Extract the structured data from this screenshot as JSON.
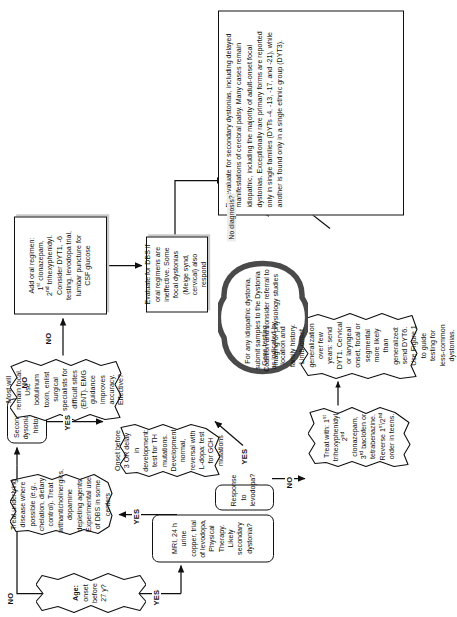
{
  "figure": {
    "type": "clinical-decision-flowchart",
    "orientation": "rotated-90-ccw",
    "background_color": "#ffffff",
    "ink_color": "#101010",
    "shadow_color": "#c8c8c8",
    "cloud_outline_color": "#4a4a4a"
  },
  "nodes": {
    "age_decision": "Age: onset before 27 y?",
    "mri_workup": "MRI, 24 h urine copper, trial of levodopa, Physical Therapy. Likely secondary dystonia?",
    "levodopa_response": "Response to levodopa?",
    "secondary_dystonia": "Secondary dysonia per history?",
    "treat_underlying": "Treat underlying disease where possible (e.g., chelation, dietary control). Treat withanticholinergics, dopamine depleting agents. Experimental use of DBS in some centers",
    "onset_before_3": "Onset before 3 OR delay in development: test for TH mutations. Development normal, reversal with L-dopa: test for GCH mutations",
    "treat_with": "Treat with: 1st trihexyphenidyl, 2nd clonazepam, 3rd baclofen or tetrabenazine. Reverse 1st/2nd order in teens.",
    "gene_testing": "Gene testing as indicated by location and family history. Limb-onset, generalization over few years: send DYT1. Cervical or laryngeal onset, focal or segmental more likely than generalized: send DYT6. Use Figure 1 to guide testing for less-common dystonias.",
    "remain_focal": "Most will remain focal. Use botulinum toxin, enlist surgical specialists for difficult sites (ENT). EMG guidance improves accuracy. Effective?",
    "add_oral": "Add oral regimen: 1st clonazepam, 2nd trihexyphenidyl. Consider DYT1, -6 testing, levodopa trial, lumbar puncture for CSF glucose",
    "evaluate_dbs": "Evaluate for DBS if oral regimens are ineffective. Some focal dystonias (Meige synd, cervical) also respond",
    "idiopathic_cloud": "For any idiopathic dystonia, submit samples to the Dystonia Coalition and consider referral to imaging or physiology studies",
    "reevaluate_note": "Re-evaluate for secondary dystonias, including delayed manifestations of cerebral palsy. Many cases remain idiopathic, including the majority of adult-onset focal dystonias. Exceptionally rare primary forms are reported only in single families (DYTs -4, -13, -17, and -21), while another is found only in a single ethnic group (DYT3)."
  },
  "node_rich": {
    "treat_with_lines": [
      "Treat with: 1st trihexy-",
      "phenidyl, 2nd clonazepam,",
      "3rd baclofen or tetrabenazine.",
      "Reverse 1st/2nd order in teens."
    ],
    "add_oral_lines": [
      "Add oral regimen:",
      "1st clonazepam,",
      "2nd trihexyphenidyl.",
      "Consider DYT1, -6",
      "testing, levodopa trial,",
      "lumbar puncture for",
      "CSF glucose"
    ]
  },
  "edge_labels": {
    "age_no": "NO",
    "age_yes": "YES",
    "secondary_yes": "YES",
    "secondary_no": "NO",
    "mri_yes": "YES",
    "levodopa_yes": "YES",
    "levodopa_no": "NO",
    "focal_no": "NO",
    "no_diagnosis": "No diagnosis?"
  }
}
